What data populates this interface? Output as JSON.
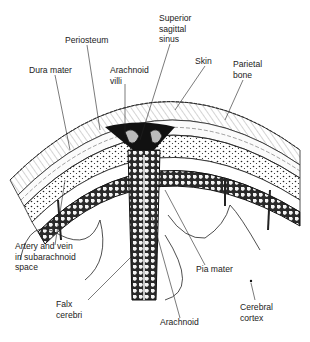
{
  "diagram": {
    "background": "#ffffff",
    "ink_color": "#1a1a1a",
    "labels": [
      {
        "id": "periosteum",
        "text": "Periosteum",
        "x": 65,
        "y": 35
      },
      {
        "id": "superior-sagittal-sinus",
        "text": "Superior\nsagittal\nsinus",
        "x": 159,
        "y": 13
      },
      {
        "id": "skin",
        "text": "Skin",
        "x": 195,
        "y": 56
      },
      {
        "id": "parietal-bone",
        "text": "Parietal\nbone",
        "x": 233,
        "y": 59
      },
      {
        "id": "dura-mater",
        "text": "Dura mater",
        "x": 29,
        "y": 65
      },
      {
        "id": "arachnoid-villi",
        "text": "Arachnoid\nvilli",
        "x": 110,
        "y": 65
      },
      {
        "id": "artery-vein",
        "text": "Artery and vein\nin subarachnoid\nspace",
        "x": 15,
        "y": 241
      },
      {
        "id": "pia-mater",
        "text": "Pia mater",
        "x": 196,
        "y": 264
      },
      {
        "id": "falx-cerebri",
        "text": "Falx\ncerebri",
        "x": 56,
        "y": 299
      },
      {
        "id": "cerebral-cortex",
        "text": "Cerebral\ncortex",
        "x": 240,
        "y": 302
      },
      {
        "id": "arachnoid",
        "text": "Arachnoid",
        "x": 160,
        "y": 317
      }
    ]
  }
}
